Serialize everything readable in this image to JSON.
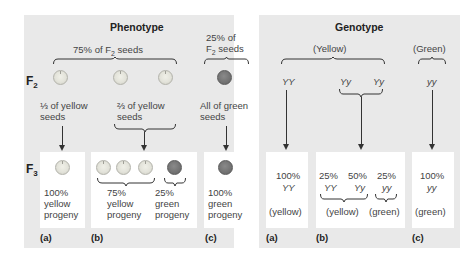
{
  "phenotype": {
    "title": "Phenotype",
    "f2_label": "F",
    "f2_sub": "2",
    "f3_label": "F",
    "f3_sub": "3",
    "group_yellow": {
      "pre": "75% of F",
      "sub": "2",
      "post": " seeds"
    },
    "group_green": {
      "line1": "25% of",
      "line2_pre": "F",
      "line2_sub": "2",
      "line2_post": " seeds"
    },
    "f2_seeds": [
      {
        "color": "yellow"
      },
      {
        "color": "yellow"
      },
      {
        "color": "yellow"
      },
      {
        "color": "green"
      }
    ],
    "descriptions": {
      "a": [
        "⅓ of yellow",
        "seeds"
      ],
      "b": [
        "⅔ of yellow",
        "seeds"
      ],
      "c": [
        "All of green",
        "seeds"
      ]
    },
    "boxes": {
      "a": {
        "seeds": [
          "yellow"
        ],
        "lines": [
          "100%",
          "yellow",
          "progeny"
        ]
      },
      "b": {
        "seeds": [
          "yellow",
          "yellow",
          "yellow",
          "green"
        ],
        "left_lines": [
          "75%",
          "yellow",
          "progeny"
        ],
        "right_lines": [
          "25%",
          "green",
          "progeny"
        ]
      },
      "c": {
        "seeds": [
          "green"
        ],
        "lines": [
          "100%",
          "green",
          "progeny"
        ]
      }
    },
    "panel_labels": [
      "(a)",
      "(b)",
      "(c)"
    ]
  },
  "genotype": {
    "title": "Genotype",
    "group_yellow": "(Yellow)",
    "group_green": "(Green)",
    "f2_genotypes": [
      "YY",
      "Yy",
      "Yy",
      "yy"
    ],
    "boxes": {
      "a": {
        "pct": "100%",
        "geno": "YY",
        "pheno": "(yellow)"
      },
      "b": {
        "items": [
          {
            "pct": "25%",
            "geno": "YY"
          },
          {
            "pct": "50%",
            "geno": "Yy"
          },
          {
            "pct": "25%",
            "geno": "yy"
          }
        ],
        "pheno_left": "(yellow)",
        "pheno_right": "(green)"
      },
      "c": {
        "pct": "100%",
        "geno": "yy",
        "pheno": "(green)"
      }
    },
    "panel_labels": [
      "(a)",
      "(b)",
      "(c)"
    ]
  },
  "colors": {
    "panel_bg": "#e9e9e9",
    "box_bg": "#ffffff",
    "yellow_seed": "#e3e3da",
    "green_seed": "#727272"
  }
}
